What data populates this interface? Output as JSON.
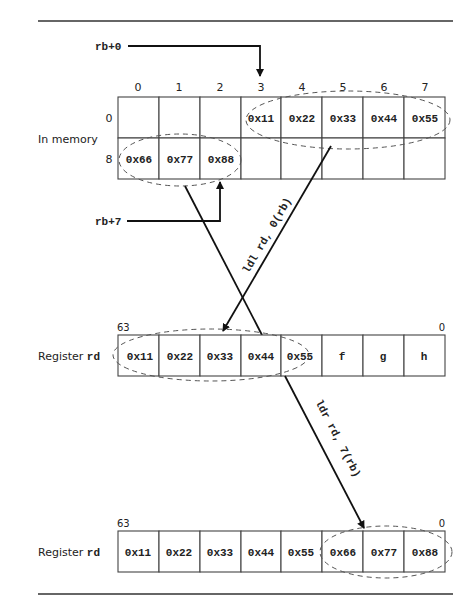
{
  "memory": {
    "label": "In memory",
    "column_headers": [
      "0",
      "1",
      "2",
      "3",
      "4",
      "5",
      "6",
      "7"
    ],
    "row_headers": [
      "0",
      "8"
    ],
    "rows": [
      [
        "",
        "",
        "",
        "0x11",
        "0x22",
        "0x33",
        "0x44",
        "0x55"
      ],
      [
        "0x66",
        "0x77",
        "0x88",
        "",
        "",
        "",
        "",
        ""
      ]
    ]
  },
  "pointers": {
    "rb0": "rb+0",
    "rb7": "rb+7"
  },
  "instructions": {
    "ldl": "ldl rd, 0(rb)",
    "ldr": "ldr rd, 7(rb)"
  },
  "register1": {
    "label_prefix": "Register ",
    "label_reg": "rd",
    "bit_high": "63",
    "bit_low": "0",
    "cells": [
      "0x11",
      "0x22",
      "0x33",
      "0x44",
      "0x55",
      "f",
      "g",
      "h"
    ]
  },
  "register2": {
    "label_prefix": "Register ",
    "label_reg": "rd",
    "bit_high": "63",
    "bit_low": "0",
    "cells": [
      "0x11",
      "0x22",
      "0x33",
      "0x44",
      "0x55",
      "0x66",
      "0x77",
      "0x88"
    ]
  }
}
